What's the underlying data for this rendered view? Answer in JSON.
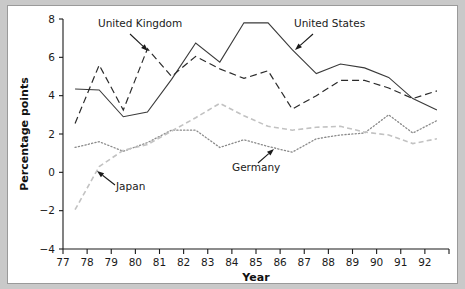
{
  "chart_data": {
    "type": "line",
    "title": "",
    "xlabel": "Year",
    "ylabel": "Percentage points",
    "xlim": [
      77,
      93
    ],
    "ylim": [
      -4,
      8
    ],
    "ytick_values": [
      -4,
      -2,
      0,
      2,
      4,
      6,
      8
    ],
    "ytick_labels": [
      "−4",
      "−2",
      "0",
      "2",
      "4",
      "6",
      "8"
    ],
    "xtick_values": [
      77,
      78,
      79,
      80,
      81,
      82,
      83,
      84,
      85,
      86,
      87,
      88,
      89,
      90,
      91,
      92
    ],
    "xtick_labels": [
      "77",
      "78",
      "79",
      "80",
      "81",
      "82",
      "83",
      "84",
      "85",
      "86",
      "87",
      "88",
      "89",
      "90",
      "91",
      "92"
    ],
    "grid": false,
    "legend": "inline-annotations",
    "series": [
      {
        "name": "United States",
        "style": "solid",
        "color": "#3a3a3a",
        "x": [
          77.5,
          78.5,
          79.5,
          80.5,
          81.5,
          82.5,
          83.5,
          84.5,
          85.5,
          86.5,
          87.5,
          88.5,
          89.5,
          90.5,
          91.5,
          92.5
        ],
        "values": [
          4.35,
          4.3,
          2.9,
          3.15,
          4.85,
          6.75,
          5.75,
          7.8,
          7.8,
          6.4,
          5.15,
          5.65,
          5.45,
          4.95,
          3.85,
          3.25
        ]
      },
      {
        "name": "United Kingdom",
        "style": "dashed",
        "color": "#2a2a2a",
        "x": [
          77.5,
          78.5,
          79.5,
          80.5,
          81.5,
          82.5,
          83.5,
          84.5,
          85.5,
          86.5,
          87.5,
          88.5,
          89.5,
          90.5,
          91.5,
          92.5
        ],
        "values": [
          2.55,
          5.6,
          3.25,
          6.45,
          5.0,
          6.05,
          5.4,
          4.9,
          5.3,
          3.3,
          4.0,
          4.8,
          4.8,
          4.4,
          3.85,
          4.25
        ]
      },
      {
        "name": "Germany",
        "style": "dotted",
        "color": "#8a8a8a",
        "x": [
          77.5,
          78.5,
          79.5,
          80.5,
          81.5,
          82.5,
          83.5,
          84.5,
          85.5,
          86.5,
          87.5,
          88.5,
          89.5,
          90.5,
          91.5,
          92.5
        ],
        "values": [
          1.3,
          1.6,
          1.1,
          1.55,
          2.2,
          2.2,
          1.3,
          1.7,
          1.35,
          1.05,
          1.75,
          1.95,
          2.05,
          3.0,
          2.05,
          2.7
        ]
      },
      {
        "name": "Japan",
        "style": "dashed-light",
        "color": "#c2c2c2",
        "x": [
          77.5,
          78.5,
          79.5,
          80.5,
          81.5,
          82.5,
          83.5,
          84.5,
          85.5,
          86.5,
          87.5,
          88.5,
          89.5,
          90.5,
          91.5,
          92.5
        ],
        "values": [
          -1.95,
          0.3,
          1.15,
          1.45,
          2.15,
          2.85,
          3.6,
          2.95,
          2.4,
          2.2,
          2.35,
          2.4,
          2.1,
          1.95,
          1.5,
          1.75
        ]
      }
    ],
    "annotations": [
      {
        "label": "United Kingdom",
        "text_x": 90,
        "text_y": 21,
        "arrow_from_x": 122,
        "arrow_from_y": 28,
        "arrow_to_x": 140,
        "arrow_to_y": 45
      },
      {
        "label": "United States",
        "text_x": 286,
        "text_y": 21,
        "arrow_from_x": 305,
        "arrow_from_y": 28,
        "arrow_to_x": 287,
        "arrow_to_y": 44
      },
      {
        "label": "Germany",
        "text_x": 224,
        "text_y": 165,
        "arrow_from_x": 250,
        "arrow_from_y": 157,
        "arrow_to_x": 266,
        "arrow_to_y": 143
      },
      {
        "label": "Japan",
        "text_x": 108,
        "text_y": 184,
        "arrow_from_x": 107,
        "arrow_from_y": 179,
        "arrow_to_x": 89,
        "arrow_to_y": 165
      }
    ]
  }
}
